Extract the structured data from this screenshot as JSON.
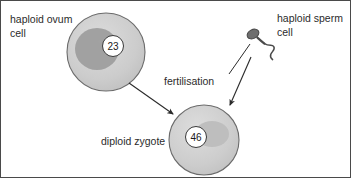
{
  "diagram": {
    "background_color": "#ffffff",
    "border_color": "#4a4a4a",
    "labels": {
      "ovum_line1": "haploid ovum",
      "ovum_line2": "cell",
      "sperm_line1": "haploid sperm",
      "sperm_line2": "cell",
      "process": "fertilisation",
      "zygote": "diploid zygote"
    },
    "cells": {
      "ovum": {
        "name": "haploid ovum cell",
        "chromosome_number": "23",
        "membrane_color": "#cfcfcf",
        "blob_color": "#9e9e9e",
        "cx": 105,
        "cy": 51,
        "r": 39
      },
      "zygote": {
        "name": "diploid zygote",
        "chromosome_number": "46",
        "membrane_color": "#cfcfcf",
        "blob_color": "#bdbdbd",
        "cx": 203,
        "cy": 139,
        "r": 35
      },
      "sperm": {
        "name": "haploid sperm cell",
        "head_color": "#5a5a5a",
        "tail_color": "#4a4a4a"
      }
    },
    "arrows": [
      {
        "name": "ovum-to-zygote",
        "from": [
          128,
          82
        ],
        "to": [
          173,
          114
        ]
      },
      {
        "name": "sperm-to-zygote",
        "from": [
          250,
          56
        ],
        "to": [
          228,
          106
        ]
      }
    ],
    "leader_lines": [
      {
        "name": "sperm-label-leader",
        "from": [
          228,
          73
        ],
        "to": [
          250,
          42
        ]
      }
    ]
  }
}
